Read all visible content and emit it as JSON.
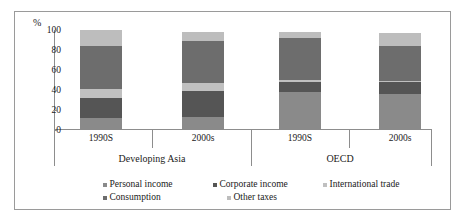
{
  "chart_data": {
    "type": "bar",
    "subtype": "stacked-column",
    "title": "",
    "xlabel": "",
    "ylabel": "%",
    "ylim": [
      0,
      100
    ],
    "yticks": [
      "0",
      "20",
      "40",
      "60",
      "80",
      "100"
    ],
    "grid": false,
    "legend_position": "bottom",
    "categories": [
      "1990S",
      "2000s",
      "1990S",
      "2000s"
    ],
    "groups": [
      {
        "label": "Developing Asia",
        "categories": [
          "1990S",
          "2000s"
        ]
      },
      {
        "label": "OECD",
        "categories": [
          "1990S",
          "2000s"
        ]
      }
    ],
    "series": [
      {
        "name": "Personal income",
        "color": "#8a8a8a",
        "values": [
          12,
          13,
          38,
          36
        ]
      },
      {
        "name": "Corporate income",
        "color": "#555555",
        "values": [
          20,
          26,
          10,
          12
        ]
      },
      {
        "name": "International trade",
        "color": "#c0c0c0",
        "values": [
          9,
          8,
          2,
          1
        ]
      },
      {
        "name": "Consumption",
        "color": "#6d6d6d",
        "values": [
          43,
          42,
          42,
          35
        ]
      },
      {
        "name": "Other taxes",
        "color": "#bdbdbd",
        "values": [
          16,
          9,
          6,
          13
        ]
      }
    ]
  },
  "axis": {
    "unit_label": "%",
    "ticks": [
      "100",
      "80",
      "60",
      "40",
      "20",
      "0"
    ]
  },
  "bars": [
    {
      "category": "1990S",
      "group": "Developing Asia"
    },
    {
      "category": "2000s",
      "group": "Developing Asia"
    },
    {
      "category": "1990S",
      "group": "OECD"
    },
    {
      "category": "2000s",
      "group": "OECD"
    }
  ],
  "group_labels": [
    "Developing Asia",
    "OECD"
  ],
  "legend": {
    "row1": [
      "Personal income",
      "Corporate income",
      "International trade"
    ],
    "row2": [
      "Consumption",
      "Other taxes"
    ]
  }
}
